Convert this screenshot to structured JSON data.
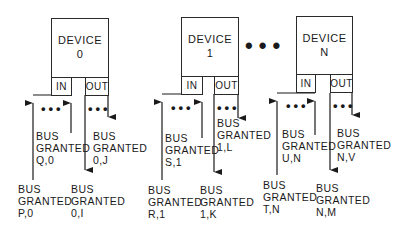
{
  "devices": [
    {
      "name": "DEVICE",
      "id": "0",
      "in_label": "IN",
      "out_label": "OUT",
      "signals": {
        "in_outer": {
          "line1": "BUS",
          "line2": "GRANTED",
          "line3": "P,0"
        },
        "in_inner": {
          "line1": "BUS",
          "line2": "GRANTED",
          "line3": "Q,0"
        },
        "out_inner": {
          "line1": "BUS",
          "line2": "GRANTED",
          "line3": "0,I"
        },
        "out_outer": {
          "line1": "BUS",
          "line2": "GRANTED",
          "line3": "0,J"
        }
      }
    },
    {
      "name": "DEVICE",
      "id": "1",
      "in_label": "IN",
      "out_label": "OUT",
      "signals": {
        "in_outer": {
          "line1": "BUS",
          "line2": "GRANTED",
          "line3": "R,1"
        },
        "in_inner": {
          "line1": "BUS",
          "line2": "GRANTED",
          "line3": "S,1"
        },
        "out_inner": {
          "line1": "BUS",
          "line2": "GRANTED",
          "line3": "1,K"
        },
        "out_outer": {
          "line1": "BUS",
          "line2": "GRANTED",
          "line3": "1,L"
        }
      }
    },
    {
      "name": "DEVICE",
      "id": "N",
      "in_label": "IN",
      "out_label": "OUT",
      "signals": {
        "in_outer": {
          "line1": "BUS",
          "line2": "GRANTED",
          "line3": "T,N"
        },
        "in_inner": {
          "line1": "BUS",
          "line2": "GRANTED",
          "line3": "U,N"
        },
        "out_inner": {
          "line1": "BUS",
          "line2": "GRANTED",
          "line3": "N,M"
        },
        "out_outer": {
          "line1": "BUS",
          "line2": "GRANTED",
          "line3": "N,V"
        }
      }
    }
  ],
  "ellipsis": {
    "between_devices": "•••",
    "port_dots": "•••"
  }
}
